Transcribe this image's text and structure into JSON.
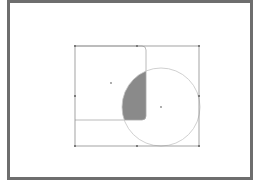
{
  "figure": {
    "type": "vector-shape-intersection",
    "colors": {
      "frame": "#6e6e6e",
      "selection": "#8c8c8c",
      "outline": "#b5b5b5",
      "fill": "#8a8a8a",
      "background": "#ffffff"
    },
    "selection_box": {
      "x": 75,
      "y": 46,
      "width": 124,
      "height": 100
    },
    "handles": [
      {
        "name": "top-left",
        "x": 75,
        "y": 46
      },
      {
        "name": "top-middle",
        "x": 137,
        "y": 46
      },
      {
        "name": "top-right",
        "x": 199,
        "y": 46
      },
      {
        "name": "middle-left",
        "x": 75,
        "y": 96
      },
      {
        "name": "middle-right",
        "x": 199,
        "y": 96
      },
      {
        "name": "bottom-left",
        "x": 75,
        "y": 146
      },
      {
        "name": "bottom-middle",
        "x": 137,
        "y": 146
      },
      {
        "name": "bottom-right",
        "x": 199,
        "y": 146
      }
    ],
    "rounded_square": {
      "x": 75,
      "y": 46,
      "width": 71,
      "height": 74,
      "corner_radius": 4
    },
    "circle": {
      "cx": 161,
      "cy": 107,
      "r": 39
    },
    "centers": [
      {
        "name": "square-center",
        "x": 111,
        "y": 83
      },
      {
        "name": "circle-center",
        "x": 161,
        "y": 107
      }
    ]
  }
}
